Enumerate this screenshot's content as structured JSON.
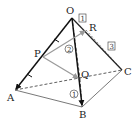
{
  "diagram": {
    "points": {
      "O": {
        "label": "O",
        "x": 72,
        "y": 18,
        "lx": 66,
        "ly": 14
      },
      "A": {
        "label": "A",
        "x": 15,
        "y": 90,
        "lx": 7,
        "ly": 101
      },
      "B": {
        "label": "B",
        "x": 82,
        "y": 107,
        "lx": 79,
        "ly": 118
      },
      "C": {
        "label": "C",
        "x": 122,
        "y": 70,
        "lx": 125,
        "ly": 75
      },
      "P": {
        "label": "P",
        "x": 43,
        "y": 57,
        "lx": 34,
        "ly": 57
      },
      "Q": {
        "label": "Q",
        "x": 80,
        "y": 79,
        "lx": 81,
        "ly": 77
      },
      "R": {
        "label": "R",
        "x": 86,
        "y": 30,
        "lx": 89,
        "ly": 31
      }
    },
    "ratio_boxes": [
      {
        "text": "1",
        "x": 79,
        "y": 14
      },
      {
        "text": "3",
        "x": 108,
        "y": 42
      }
    ],
    "circled_numbers": [
      {
        "text": "2",
        "x": 69,
        "y": 49
      },
      {
        "text": "1",
        "x": 74,
        "y": 94
      }
    ],
    "colors": {
      "edge": "#222222",
      "vector": "#111111",
      "gray_vector": "#9a9a9a",
      "dashed": "#333333"
    }
  }
}
